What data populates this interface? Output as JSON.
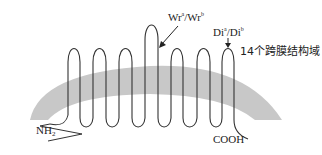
{
  "diagram": {
    "type": "membrane-topology",
    "membrane_color": "#c8c8c8",
    "strand_color": "#333333",
    "labels": {
      "wr_main": "Wr",
      "wr_sup_a": "a",
      "wr_sep": "/Wr",
      "wr_sup_b": "b",
      "di_main": "Di",
      "di_sup_a": "a",
      "di_sep": "/Di",
      "di_sup_b": "b",
      "domain_label": "14个跨膜结构域",
      "n_term_main": "NH",
      "n_term_sub": "2",
      "c_term": "COOH"
    },
    "transmembrane_domains": 14
  }
}
